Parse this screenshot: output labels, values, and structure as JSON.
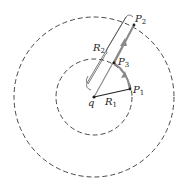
{
  "diagram": {
    "title": "",
    "colors": {
      "circle": "#333333",
      "path": "#8a8a8a",
      "radius_line": "#222222",
      "text": "#222222"
    },
    "center": {
      "x": 94,
      "y": 97
    },
    "circles": [
      {
        "name": "inner",
        "r": 38,
        "style": "dashed"
      },
      {
        "name": "outer",
        "r": 80,
        "style": "dashed"
      }
    ],
    "labels": {
      "q": "q",
      "R1": {
        "base": "R",
        "sub": "1"
      },
      "R2": {
        "base": "R",
        "sub": "2"
      },
      "P1": {
        "base": "P",
        "sub": "1"
      },
      "P2": {
        "base": "P",
        "sub": "2"
      },
      "P3": {
        "base": "P",
        "sub": "3"
      }
    },
    "points": {
      "q": {
        "x": 94,
        "y": 97
      },
      "P1": {
        "x": 130,
        "y": 89
      },
      "P3": {
        "x": 114,
        "y": 63
      },
      "P2": {
        "x": 134,
        "y": 25
      }
    }
  }
}
